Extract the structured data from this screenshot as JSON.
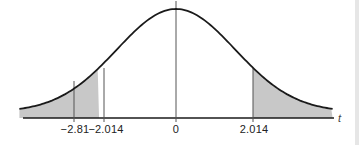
{
  "chart_data": {
    "type": "area",
    "title": "",
    "xlabel": "t",
    "ylabel": "",
    "xlim": [
      -4.1,
      4.1
    ],
    "grid": false,
    "legend": null,
    "curve": "t-distribution (bell-shaped density)",
    "vertical_lines": [
      {
        "x": -2.81,
        "label": "−2.81"
      },
      {
        "x": -2.014,
        "label": "−2.014"
      },
      {
        "x": 0,
        "label": "0"
      },
      {
        "x": 2.014,
        "label": "2.014"
      }
    ],
    "shaded_regions": [
      {
        "from": -4.1,
        "to": -2.014,
        "side": "left tail"
      },
      {
        "from": 2.014,
        "to": 4.1,
        "side": "right tail"
      }
    ],
    "colors": {
      "curve": "#1a1a1a",
      "shade": "#c8c8c8",
      "axis": "#1a1a1a",
      "line": "#555555"
    }
  },
  "labels": {
    "tick_neg281": "−2.81",
    "tick_neg2014": "−2.014",
    "tick_zero": "0",
    "tick_pos2014": "2.014",
    "axis_var": "t"
  }
}
